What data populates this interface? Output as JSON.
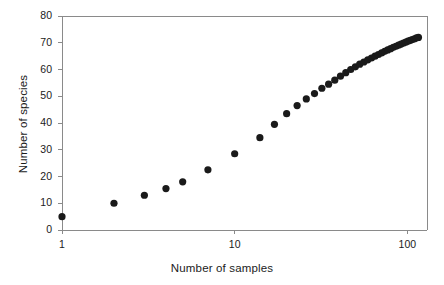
{
  "chart_data": {
    "type": "scatter",
    "title": "",
    "xlabel": "Number of samples",
    "ylabel": "Number of species",
    "xscale": "log",
    "yscale": "linear",
    "xlim": [
      1,
      130
    ],
    "ylim": [
      0,
      80
    ],
    "xticks": [
      1,
      10,
      100
    ],
    "xtick_labels": [
      "1",
      "10",
      "100"
    ],
    "yticks": [
      0,
      10,
      20,
      30,
      40,
      50,
      60,
      70,
      80
    ],
    "ytick_labels": [
      "0",
      "10",
      "20",
      "30",
      "40",
      "50",
      "60",
      "70",
      "80"
    ],
    "grid": false,
    "legend": null,
    "marker": "filled-circle",
    "marker_color": "#1a1a1a",
    "marker_size": 6,
    "series": [
      {
        "name": "species accumulation",
        "x": [
          1,
          2,
          3,
          4,
          5,
          7,
          10,
          14,
          17,
          20,
          23,
          26,
          29,
          32,
          35,
          38,
          41,
          44,
          47,
          50,
          53,
          56,
          59,
          62,
          65,
          68,
          71,
          74,
          77,
          80,
          83,
          86,
          89,
          92,
          95,
          98,
          101,
          104,
          107,
          110,
          113,
          116
        ],
        "y": [
          5,
          10,
          13,
          15.5,
          18,
          22.5,
          28.5,
          34.5,
          39.5,
          43.5,
          46.5,
          49,
          51,
          53,
          54.5,
          56,
          57.5,
          58.8,
          60,
          61,
          62,
          62.8,
          63.6,
          64.3,
          65,
          65.6,
          66.2,
          66.8,
          67.3,
          67.8,
          68.3,
          68.7,
          69.1,
          69.5,
          69.9,
          70.2,
          70.6,
          70.9,
          71.2,
          71.5,
          71.8,
          72
        ]
      }
    ]
  },
  "axes": {
    "ylabel_text": "Number of species",
    "xlabel_text": "Number of samples"
  }
}
